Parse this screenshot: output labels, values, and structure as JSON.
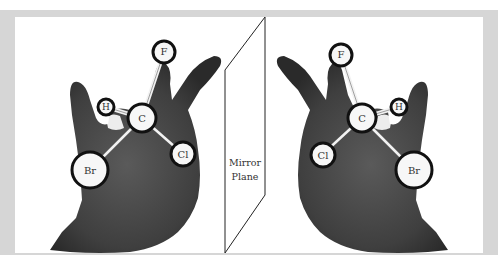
{
  "figure": {
    "mirror": {
      "line1": "Mirror",
      "line2": "Plane"
    },
    "left_molecule": {
      "center": "C",
      "atoms": [
        {
          "symbol": "F"
        },
        {
          "symbol": "H"
        },
        {
          "symbol": "Br"
        },
        {
          "symbol": "Cl"
        }
      ]
    },
    "right_molecule": {
      "center": "C",
      "atoms": [
        {
          "symbol": "F"
        },
        {
          "symbol": "H"
        },
        {
          "symbol": "Cl"
        },
        {
          "symbol": "Br"
        }
      ]
    },
    "colors": {
      "frame": "#d6d6d6",
      "hand": "#4a4a4a",
      "atom_fill": "#f7f7f7",
      "atom_stroke": "#111111"
    }
  }
}
